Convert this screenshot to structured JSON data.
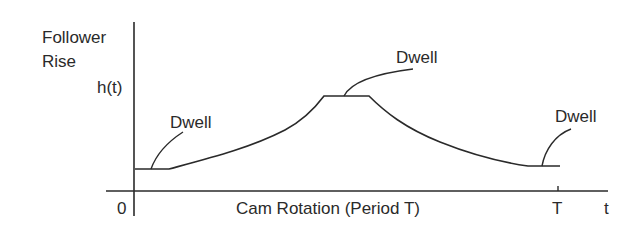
{
  "diagram": {
    "y_axis": {
      "label_line1": "Follower",
      "label_line2": "Rise",
      "function_label": "h(t)"
    },
    "x_axis": {
      "origin_label": "0",
      "label": "Cam Rotation (Period T)",
      "period_tick_label": "T",
      "variable_label": "t"
    },
    "annotations": [
      {
        "text": "Dwell",
        "position": "start-low"
      },
      {
        "text": "Dwell",
        "position": "peak"
      },
      {
        "text": "Dwell",
        "position": "end-low"
      }
    ],
    "line_color": "#2a2a2a"
  }
}
